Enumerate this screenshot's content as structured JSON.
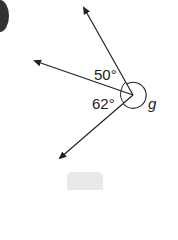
{
  "diagram": {
    "type": "angles-around-a-point",
    "angles": [
      {
        "label": "50°",
        "value": 50
      },
      {
        "label": "62°",
        "value": 62
      },
      {
        "label": "g",
        "value": null
      }
    ],
    "rays": [
      {
        "name": "upper",
        "tip": [
          83,
          6
        ]
      },
      {
        "name": "left",
        "tip": [
          33,
          60
        ]
      },
      {
        "name": "lower",
        "tip": [
          59,
          160
        ]
      }
    ],
    "vertex": [
      133,
      95
    ],
    "colors": {
      "line": "#222222",
      "bullet": "#333333",
      "answer_box": "#e9e9e9"
    }
  }
}
